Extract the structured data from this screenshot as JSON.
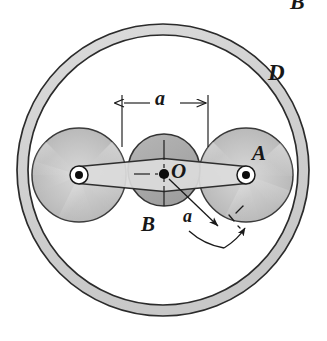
{
  "figure": {
    "type": "mechanical-diagram",
    "width": 327,
    "height": 341,
    "background": "#ffffff"
  },
  "labels": {
    "ring": "D",
    "right_disc": "A",
    "center_disc": "B",
    "center_point": "O",
    "dimension_top": "a",
    "dimension_radial": "a",
    "cut_off_top": "B"
  },
  "colors": {
    "ring_fill": "#d2d2d2",
    "ring_stroke": "#2b2b2b",
    "center_disc_fill": "#a9a9a9",
    "center_disc_stroke": "#333333",
    "side_disc_light": "#e8e8e8",
    "side_disc_mid": "#c2c2c2",
    "side_disc_dark": "#9e9e9e",
    "link_fill": "#dcdcdc",
    "link_stroke": "#2e2e2e",
    "pin_ring": "#ffffff",
    "pin_dot": "#0c0c0c",
    "line": "#1a1a1a",
    "text": "#171717"
  },
  "geometry": {
    "ring": {
      "cx": 163,
      "cy": 170,
      "r_outer": 146,
      "r_inner": 135
    },
    "disc_left": {
      "cx": 79,
      "cy": 175,
      "r": 47
    },
    "disc_center": {
      "cx": 164,
      "cy": 170,
      "r": 36
    },
    "disc_right": {
      "cx": 246,
      "cy": 175,
      "r": 47
    },
    "pin_left": {
      "cx": 79,
      "cy": 175,
      "r_outer": 9,
      "r_inner": 4
    },
    "pin_right": {
      "cx": 246,
      "cy": 175,
      "r_outer": 9,
      "r_inner": 4
    },
    "dimension_line": {
      "x1": 122,
      "x2": 208,
      "y": 103
    },
    "extension_left": {
      "x": 122,
      "y1": 96,
      "y2": 146
    },
    "extension_right": {
      "x": 208,
      "y1": 96,
      "y2": 146
    },
    "radial_arrow": {
      "x1": 167,
      "y1": 173,
      "x2": 221,
      "y2": 229
    },
    "rotation_arc": {
      "cx": 164,
      "cy": 170,
      "r": 84,
      "start_deg": 33,
      "end_deg": 72
    }
  },
  "annotations": {
    "dimension_top_meaning": "distance a between center O and pin centers",
    "dimension_radial_meaning": "radius a from O to orbiting pin"
  }
}
